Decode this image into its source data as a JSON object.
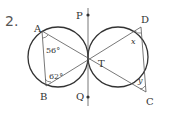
{
  "problem": {
    "number": "2."
  },
  "figure": {
    "points": {
      "A": "A",
      "B": "B",
      "C": "C",
      "D": "D",
      "P": "P",
      "Q": "Q",
      "T": "T"
    },
    "angles": {
      "at_A": "56°",
      "at_B": "62°",
      "at_D": "x",
      "at_C": "y"
    },
    "colors": {
      "stroke": "#333333",
      "thin": "#555555"
    }
  }
}
